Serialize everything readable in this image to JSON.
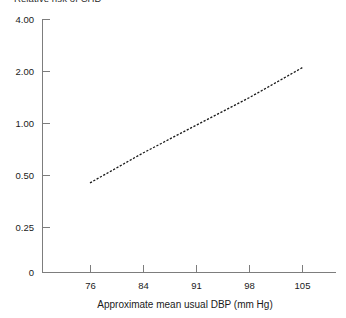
{
  "chart_data": {
    "type": "line",
    "title": "Relative risk of CHD",
    "subtitle": "",
    "xlabel": "Approximate mean usual  DBP (mm Hg)",
    "ylabel": "",
    "x": [
      76,
      84,
      91,
      98,
      105
    ],
    "xtick_labels": [
      "76",
      "84",
      "91",
      "98",
      "105"
    ],
    "ytick_labels": [
      "4.00",
      "2.00",
      "1.00",
      "0.50",
      "0.25",
      "0"
    ],
    "ytick_values": [
      4.0,
      2.0,
      1.0,
      0.5,
      0.25,
      0
    ],
    "yscale": "log",
    "ylim": [
      0.25,
      4.0
    ],
    "xlim": [
      76,
      105
    ],
    "grid": false,
    "legend": false,
    "series": [
      {
        "name": "Relative risk of CHD",
        "linestyle": "dashed",
        "color": "#1a1a1a",
        "values": [
          0.45,
          0.67,
          0.97,
          1.4,
          2.1
        ]
      }
    ],
    "annotations": []
  },
  "axes": {
    "line_color": "#7d7d7d",
    "tick_color": "#7d7d7d"
  }
}
